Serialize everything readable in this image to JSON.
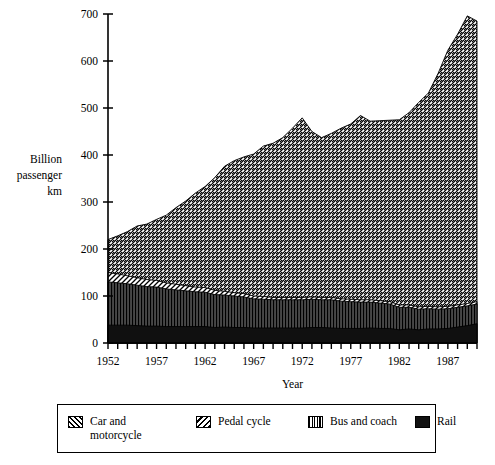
{
  "chart_data": {
    "type": "area",
    "stacked": true,
    "title": "",
    "xlabel": "Year",
    "ylabel": "Billion\npassenger\nkm",
    "ylabel_lines": [
      "Billion",
      "passenger",
      "km"
    ],
    "xlim": [
      1952,
      1990
    ],
    "ylim": [
      0,
      700
    ],
    "ytick_values": [
      0,
      100,
      200,
      300,
      400,
      500,
      600,
      700
    ],
    "ytick_labels": [
      "0",
      "100",
      "200",
      "300",
      "400",
      "500",
      "600",
      "700"
    ],
    "xtick_values": [
      1952,
      1953,
      1954,
      1955,
      1956,
      1957,
      1958,
      1959,
      1960,
      1961,
      1962,
      1963,
      1964,
      1965,
      1966,
      1967,
      1968,
      1969,
      1970,
      1971,
      1972,
      1973,
      1974,
      1975,
      1976,
      1977,
      1978,
      1979,
      1980,
      1981,
      1982,
      1983,
      1984,
      1985,
      1986,
      1987,
      1988,
      1989,
      1990
    ],
    "xtick_labels_shown": [
      "1952",
      "1957",
      "1962",
      "1967",
      "1972",
      "1977",
      "1982",
      "1987"
    ],
    "xtick_label_values": [
      1952,
      1957,
      1962,
      1967,
      1972,
      1977,
      1982,
      1987
    ],
    "grid": false,
    "legend_position": "below",
    "x": [
      1952,
      1953,
      1954,
      1955,
      1956,
      1957,
      1958,
      1959,
      1960,
      1961,
      1962,
      1963,
      1964,
      1965,
      1966,
      1967,
      1968,
      1969,
      1970,
      1971,
      1972,
      1973,
      1974,
      1975,
      1976,
      1977,
      1978,
      1979,
      1980,
      1981,
      1982,
      1983,
      1984,
      1985,
      1986,
      1987,
      1988,
      1989,
      1990
    ],
    "series": [
      {
        "name": "Rail",
        "pattern": "solid-black",
        "stack_order": 1,
        "values": [
          38,
          38,
          38,
          37,
          36,
          36,
          35,
          35,
          35,
          35,
          35,
          33,
          34,
          33,
          33,
          32,
          32,
          32,
          32,
          32,
          32,
          33,
          33,
          32,
          31,
          31,
          31,
          32,
          31,
          31,
          28,
          30,
          28,
          30,
          30,
          31,
          34,
          37,
          41
        ]
      },
      {
        "name": "Bus and coach",
        "pattern": "vertical-lines",
        "stack_order": 2,
        "values": [
          92,
          90,
          88,
          86,
          84,
          83,
          80,
          78,
          76,
          74,
          73,
          70,
          68,
          67,
          65,
          62,
          61,
          60,
          60,
          60,
          60,
          60,
          59,
          60,
          58,
          57,
          56,
          55,
          54,
          52,
          48,
          46,
          44,
          43,
          42,
          42,
          42,
          42,
          42
        ]
      },
      {
        "name": "Pedal cycle",
        "pattern": "backslash-hatch",
        "stack_order": 3,
        "values": [
          20,
          19,
          17,
          16,
          15,
          14,
          13,
          12,
          11,
          10,
          10,
          9,
          8,
          7,
          7,
          6,
          6,
          5,
          5,
          5,
          5,
          5,
          5,
          5,
          5,
          5,
          5,
          5,
          5,
          5,
          5,
          5,
          5,
          5,
          5,
          5,
          5,
          5,
          5
        ]
      },
      {
        "name": "Car and motorcycle",
        "pattern": "forwardslash-hatch",
        "stack_order": 4,
        "values": [
          70,
          81,
          94,
          110,
          118,
          130,
          144,
          163,
          180,
          200,
          215,
          240,
          266,
          281,
          291,
          302,
          320,
          328,
          340,
          360,
          382,
          352,
          340,
          349,
          363,
          373,
          392,
          380,
          383,
          386,
          394,
          409,
          435,
          454,
          497,
          545,
          576,
          612,
          597
        ]
      }
    ],
    "stacked_totals": [
      220,
      228,
      237,
      249,
      253,
      263,
      272,
      288,
      302,
      319,
      333,
      352,
      376,
      388,
      396,
      402,
      419,
      425,
      437,
      457,
      479,
      450,
      437,
      446,
      457,
      466,
      484,
      472,
      473,
      474,
      475,
      490,
      512,
      532,
      574,
      623,
      657,
      696,
      685
    ],
    "legend": [
      {
        "label": "Car and\nmotorcycle",
        "pattern": "forwardslash-hatch"
      },
      {
        "label": "Pedal cycle",
        "pattern": "backslash-hatch"
      },
      {
        "label": "Bus and coach",
        "pattern": "vertical-lines"
      },
      {
        "label": "Rail",
        "pattern": "solid-black"
      }
    ]
  },
  "colors": {
    "axis": "#000000",
    "background": "#ffffff",
    "ink": "#000000"
  }
}
